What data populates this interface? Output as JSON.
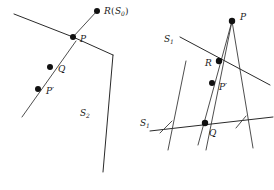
{
  "figure": {
    "background_color": "#ffffff",
    "stroke_color": "#2a2a2a",
    "dot_color": "#111111",
    "width": 274,
    "height": 190
  },
  "left_panel": {
    "name": "left-diagram",
    "labels": {
      "r_s0": {
        "base": "R",
        "open_paren": "(",
        "inner_base": "S",
        "inner_sub": "0",
        "close_paren": ")",
        "full_text": "R(S0)",
        "x": 106,
        "y": 14
      },
      "p": {
        "text": "P",
        "x": 80,
        "y": 42
      },
      "q": {
        "text": "Q",
        "x": 58,
        "y": 72
      },
      "p_prime": {
        "text": "P′",
        "x": 46,
        "y": 94
      },
      "s2": {
        "base": "S",
        "sub": "2",
        "full_text": "S2",
        "x": 80,
        "y": 116
      }
    },
    "dots": [
      {
        "name": "dot-r-s0",
        "cx": 97,
        "cy": 11,
        "r": 3.0
      },
      {
        "name": "dot-p",
        "cx": 73,
        "cy": 37,
        "r": 3.0
      },
      {
        "name": "dot-q",
        "cx": 50,
        "cy": 67,
        "r": 3.0
      },
      {
        "name": "dot-p-prime",
        "cx": 38,
        "cy": 89,
        "r": 3.0
      }
    ],
    "segments": [
      {
        "name": "wedge-upper-left-edge",
        "points": "14,14 73,37"
      },
      {
        "name": "wedge-upper-right-edge",
        "points": "73,37 113,55"
      },
      {
        "name": "wedge-descending-right-edge",
        "points": "113,55 103,172"
      },
      {
        "name": "ray-through-q-pprime",
        "points": "76,41 22,117"
      },
      {
        "name": "segment-p-to-rs0",
        "points": "73,37 97,11"
      }
    ]
  },
  "right_panel": {
    "name": "right-diagram",
    "labels": {
      "p": {
        "text": "P",
        "x": 243,
        "y": 20
      },
      "s1_upper": {
        "base": "S",
        "sub": "1",
        "full_text": "S1",
        "x": 166,
        "y": 42
      },
      "r": {
        "text": "R",
        "x": 207,
        "y": 66
      },
      "p_prime": {
        "text": "P′",
        "x": 221,
        "y": 90
      },
      "s1_lower": {
        "base": "S",
        "sub": "1",
        "full_text": "S1",
        "x": 142,
        "y": 126
      },
      "q": {
        "text": "Q",
        "x": 211,
        "y": 136
      }
    },
    "dots": [
      {
        "name": "dot-p",
        "cx": 232,
        "cy": 21,
        "r": 3.2
      },
      {
        "name": "dot-r",
        "cx": 219,
        "cy": 61,
        "r": 3.2
      },
      {
        "name": "dot-p-prime",
        "cx": 212,
        "cy": 83,
        "r": 3.0
      },
      {
        "name": "dot-q",
        "cx": 205,
        "cy": 123,
        "r": 3.2
      }
    ],
    "segments": [
      {
        "name": "fan-line-left-through-q",
        "points": "232,21 198,145"
      },
      {
        "name": "fan-line-middle-through-r",
        "points": "232,21 206,150"
      },
      {
        "name": "fan-line-right",
        "points": "232,21 253,148"
      },
      {
        "name": "s1-upper-transversal",
        "points": "180,37 270,85"
      },
      {
        "name": "s1-lower-transversal",
        "points": "150,131 273,117"
      },
      {
        "name": "cross-line-left-lower",
        "points": "186,61 168,150"
      },
      {
        "name": "tick-left-short",
        "points": "160,133 172,121"
      },
      {
        "name": "tick-right-short",
        "points": "236,128 246,116"
      }
    ]
  }
}
